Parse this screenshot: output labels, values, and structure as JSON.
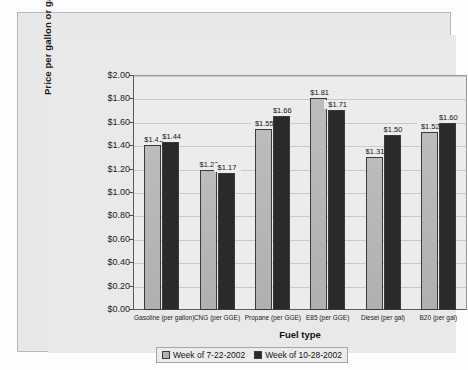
{
  "chart_data": {
    "type": "bar",
    "title": "",
    "xlabel": "Fuel type",
    "ylabel": "Price per gallon or gasoline equivalent",
    "categories": [
      "Gasoline (per gallon)",
      "CNG (per GGE)",
      "Propane (per GGE)",
      "E85 (per GGE)",
      "Diesel (per gal)",
      "B20 (per gal)"
    ],
    "series": [
      {
        "name": "Week of 7-22-2002",
        "color": "#b2b2b2",
        "values": [
          1.41,
          1.2,
          1.55,
          1.81,
          1.31,
          1.52
        ],
        "labels": [
          "$1.41",
          "$1.20",
          "$1.55",
          "$1.81",
          "$1.31",
          "$1.52"
        ]
      },
      {
        "name": "Week of 10-28-2002",
        "color": "#2a2a2a",
        "values": [
          1.44,
          1.17,
          1.66,
          1.71,
          1.5,
          1.6
        ],
        "labels": [
          "$1.44",
          "$1.17",
          "$1.66",
          "$1.71",
          "$1.50",
          "$1.60"
        ]
      }
    ],
    "ylim": [
      0,
      2.0
    ],
    "ytick_step": 0.2,
    "yticks": [
      0,
      0.2,
      0.4,
      0.6,
      0.8,
      1.0,
      1.2,
      1.4,
      1.6,
      1.8,
      2.0
    ],
    "ytick_labels": [
      "$0.00",
      "$0.20",
      "$0.40",
      "$0.60",
      "$0.80",
      "$1.00",
      "$1.20",
      "$1.40",
      "$1.60",
      "$1.80",
      "$2.00"
    ],
    "grid": true,
    "legend_position": "bottom"
  },
  "axes": {
    "y_title": "Price per gallon or gasoline equivalent",
    "x_title": "Fuel type"
  },
  "legend": {
    "items": [
      {
        "label": "Week of 7-22-2002"
      },
      {
        "label": "Week of 10-28-2002"
      }
    ]
  }
}
